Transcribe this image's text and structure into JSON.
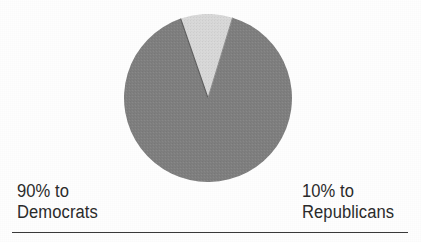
{
  "figure": {
    "background_color": "#fefefe",
    "rule": {
      "name": "baseline-rule",
      "color": "#3a3a3a"
    }
  },
  "labels": {
    "left": {
      "line1": "90% to",
      "line2": "Democrats"
    },
    "right": {
      "line1": "10% to",
      "line2": "Republicans"
    }
  },
  "chart_data": {
    "type": "pie",
    "title": "",
    "subtitle": "",
    "xlabel": "",
    "ylabel": "",
    "grid": false,
    "legend_position": "below-outside",
    "units": "percent",
    "start_angle_deg": 17,
    "direction": "clockwise",
    "categories": [
      "Democrats",
      "Republicans"
    ],
    "values": [
      90,
      10
    ],
    "labels": [
      "90% to Democrats",
      "10% to Republicans"
    ],
    "slices": [
      {
        "name": "Democrats",
        "value": 90,
        "display": "90%",
        "color": "#808080",
        "start_angle_deg": 53,
        "end_angle_deg": 377
      },
      {
        "name": "Republicans",
        "value": 10,
        "display": "10%",
        "color": "#d9d9d9",
        "start_angle_deg": 17,
        "end_angle_deg": 53
      }
    ],
    "center": {
      "x": 208,
      "y": 98
    },
    "radius": 84
  }
}
